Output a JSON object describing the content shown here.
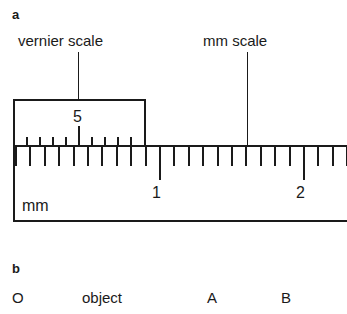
{
  "figure": {
    "width": 347,
    "height": 314,
    "background": "#ffffff",
    "ink": "#1a1a1a"
  },
  "panel_a": {
    "letter": "a",
    "callouts": [
      {
        "name": "vernier-scale-callout",
        "text": "vernier scale",
        "x": 18,
        "y": 33,
        "leader_x": 78,
        "leader_top": 52,
        "leader_bottom": 99
      },
      {
        "name": "mm-scale-callout",
        "text": "mm scale",
        "x": 203,
        "y": 33,
        "leader_x": 247,
        "leader_top": 52,
        "leader_bottom": 145
      }
    ],
    "vernier_scale": {
      "number_label": "5",
      "box": {
        "x": 13,
        "y": 99,
        "width": 133,
        "height": 47
      },
      "tick_count": 9,
      "highlighted_tick_index": 4,
      "tick_spacing": 13.0,
      "tick_first_x": 24,
      "tick_short_height": 11,
      "tick_long_height": 22
    },
    "mm_ruler": {
      "unit_label": "mm",
      "body": {
        "x": 13,
        "y": 145,
        "width": 334,
        "height": 77
      },
      "zero_x": 13,
      "tick_spacing": 14.4,
      "minor_tick_height": 19,
      "major_tick_height": 33,
      "numbered_marks": [
        {
          "label": "1",
          "x": 154
        },
        {
          "label": "2",
          "x": 298
        }
      ],
      "total_ticks": 24
    }
  },
  "panel_b": {
    "letter": "b",
    "points": [
      {
        "name": "point-label-o",
        "text": "O",
        "x": 12
      },
      {
        "name": "point-label-object",
        "text": "object",
        "x": 82
      },
      {
        "name": "point-label-a",
        "text": "A",
        "x": 207
      },
      {
        "name": "point-label-b",
        "text": "B",
        "x": 281
      }
    ],
    "row_y": 290
  }
}
